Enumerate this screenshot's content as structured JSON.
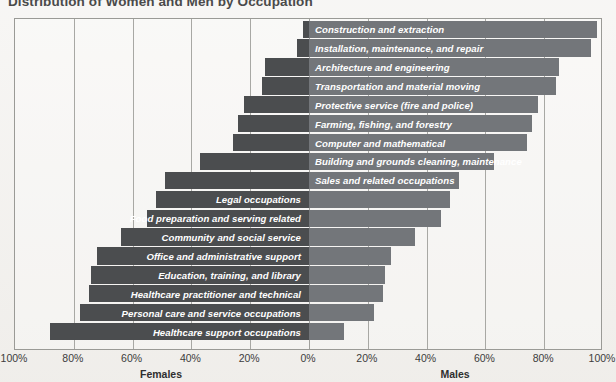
{
  "title": "Distribution of Women and Men by Occupation",
  "axis": {
    "ticks": [
      "100%",
      "80%",
      "60%",
      "40%",
      "20%",
      "0%",
      "20%",
      "40%",
      "60%",
      "80%",
      "100%"
    ],
    "left_caption": "Females",
    "right_caption": "Males"
  },
  "colors": {
    "female_bar": "#4b4d4f",
    "male_bar": "#73767a",
    "background": "#f1efec",
    "grid": "#a8a8a4",
    "label_text": "#ffffff"
  },
  "chart_data": {
    "type": "bar",
    "subtype": "diverging-stacked-bar",
    "title": "Distribution of Women and Men by Occupation",
    "xlabel": "",
    "ylabel": "",
    "xlim": [
      -100,
      100
    ],
    "grid": true,
    "legend_position": "axis-captions",
    "xtick_labels": [
      "100%",
      "80%",
      "60%",
      "40%",
      "20%",
      "0%",
      "20%",
      "40%",
      "60%",
      "80%",
      "100%"
    ],
    "xtick_values": [
      -100,
      -80,
      -60,
      -40,
      -20,
      0,
      20,
      40,
      60,
      80,
      100
    ],
    "categories": [
      "Construction and extraction",
      "Installation, maintenance, and repair",
      "Architecture and engineering",
      "Transportation and material moving",
      "Protective service (fire and police)",
      "Farming, fishing, and forestry",
      "Computer and mathematical",
      "Building and grounds cleaning, maintenance",
      "Sales and related occupations",
      "Legal occupations",
      "Food preparation and serving related",
      "Community and social service",
      "Office and administrative support",
      "Education, training, and library",
      "Healthcare practitioner and technical",
      "Personal care and service occupations",
      "Healthcare support occupations"
    ],
    "series": [
      {
        "name": "Females",
        "values": [
          2,
          4,
          15,
          16,
          22,
          24,
          26,
          37,
          49,
          52,
          55,
          64,
          72,
          74,
          75,
          78,
          88
        ]
      },
      {
        "name": "Males",
        "values": [
          98,
          96,
          85,
          84,
          78,
          76,
          74,
          63,
          51,
          48,
          45,
          36,
          28,
          26,
          25,
          22,
          12
        ]
      }
    ]
  }
}
